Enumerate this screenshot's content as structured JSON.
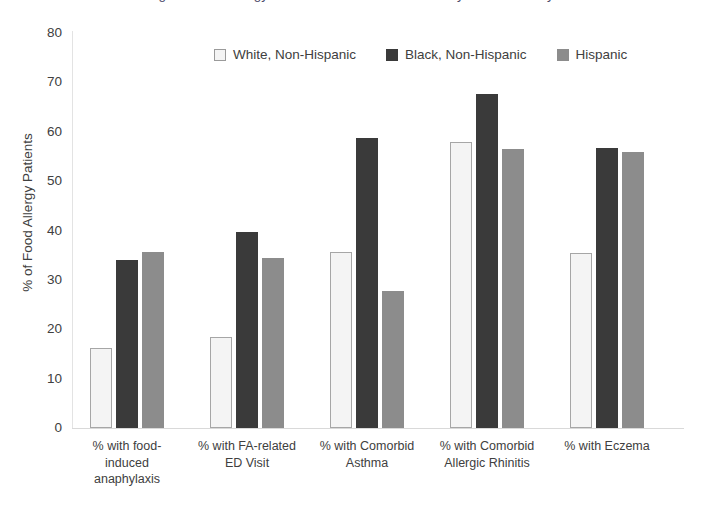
{
  "title_sliver": "Figure: Food Allergy Comorbidities and Outcomes by Race/Ethnicity",
  "chart_data": {
    "type": "bar",
    "title": "",
    "xlabel": "",
    "ylabel": "% of Food Allergy Patients",
    "ylim": [
      0,
      80
    ],
    "ytick_step": 10,
    "yticks": [
      "80",
      "70",
      "60",
      "50",
      "40",
      "30",
      "20",
      "10",
      "0"
    ],
    "grid": false,
    "legend_position": "top-center",
    "categories": [
      "% with food-induced anaphylaxis",
      "% with FA-related ED Visit",
      "% with Comorbid Asthma",
      "% with Comorbid Allergic Rhinitis",
      "% with Eczema"
    ],
    "category_lines": [
      [
        "% with food-",
        "induced",
        "anaphylaxis"
      ],
      [
        "% with FA-related",
        "ED Visit"
      ],
      [
        "% with Comorbid",
        "Asthma"
      ],
      [
        "% with Comorbid",
        "Allergic Rhinitis"
      ],
      [
        "% with Eczema"
      ]
    ],
    "series": [
      {
        "name": "White, Non-Hispanic",
        "color": "#f4f4f4",
        "border": "#a6a6a6",
        "swatch": "sw-white",
        "values": [
          16.3,
          18.4,
          35.6,
          57.9,
          35.4
        ]
      },
      {
        "name": "Black, Non-Hispanic",
        "color": "#3a3a3a",
        "border": "#3a3a3a",
        "swatch": "sw-black",
        "values": [
          34.0,
          39.6,
          58.8,
          67.6,
          56.7
        ]
      },
      {
        "name": "Hispanic",
        "color": "#8c8c8c",
        "border": "#8c8c8c",
        "swatch": "sw-gray",
        "values": [
          35.6,
          34.5,
          27.8,
          56.5,
          56.0
        ]
      }
    ]
  }
}
